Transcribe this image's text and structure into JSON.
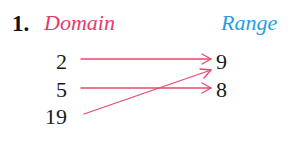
{
  "problem": {
    "number": "1.",
    "domain_label": "Domain",
    "range_label": "Range"
  },
  "domain": [
    "2",
    "5",
    "19"
  ],
  "range": [
    "9",
    "8"
  ],
  "mappings": [
    {
      "from": "2",
      "to": "9"
    },
    {
      "from": "5",
      "to": "8"
    },
    {
      "from": "19",
      "to": "9"
    }
  ],
  "colors": {
    "domain_label": "#e23d6b",
    "range_label": "#2a9de0",
    "arrow": "#e8486f",
    "text": "#1a1a1a"
  }
}
